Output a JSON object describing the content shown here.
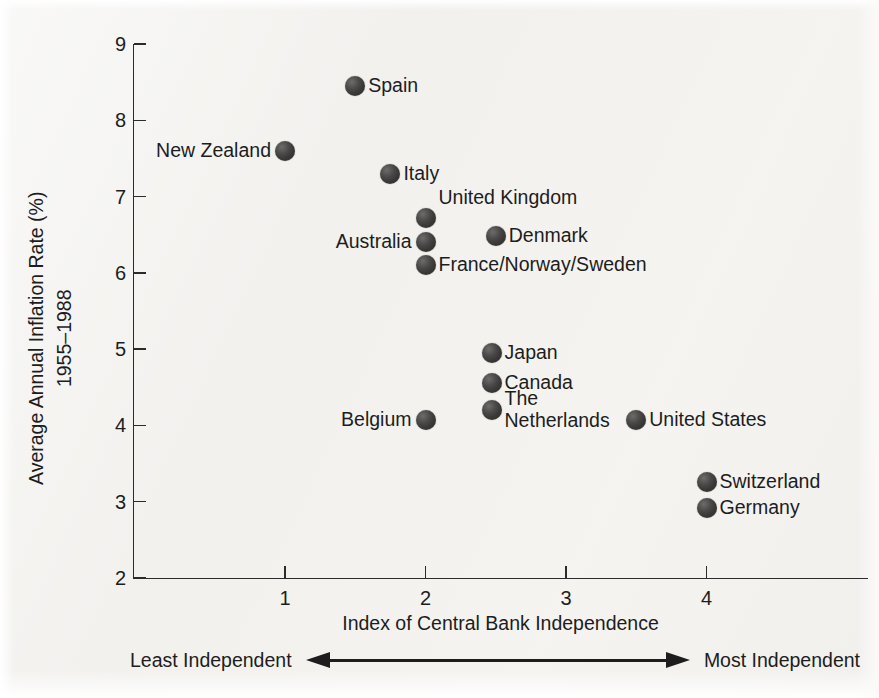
{
  "chart_data": {
    "type": "scatter",
    "title": "",
    "xlabel": "Index of Central Bank Independence",
    "ylabel": "Average Annual Inflation Rate (%)\n1955–1988",
    "ylabel_line1": "Average Annual Inflation Rate (%)",
    "ylabel_line2": "1955–1988",
    "xlim": [
      0,
      5.15
    ],
    "ylim": [
      2,
      9
    ],
    "grid": false,
    "legend": "none",
    "x_ticks": [
      1,
      2,
      3,
      4
    ],
    "x_tick_labels": [
      "1",
      "2",
      "3",
      "4"
    ],
    "y_ticks": [
      2,
      3,
      4,
      5,
      6,
      7,
      8,
      9
    ],
    "y_tick_labels": [
      "2",
      "3",
      "4",
      "5",
      "6",
      "7",
      "8",
      "9"
    ],
    "points": [
      {
        "label": "Spain",
        "x": 1.5,
        "y": 8.45,
        "label_side": "right"
      },
      {
        "label": "New Zealand",
        "x": 1.0,
        "y": 7.6,
        "label_side": "left"
      },
      {
        "label": "Italy",
        "x": 1.75,
        "y": 7.3,
        "label_side": "right"
      },
      {
        "label": "United Kingdom",
        "x": 2.0,
        "y": 6.72,
        "label_side": "right-up"
      },
      {
        "label": "Australia",
        "x": 2.0,
        "y": 6.41,
        "label_side": "left"
      },
      {
        "label": "France/Norway/Sweden",
        "x": 2.0,
        "y": 6.1,
        "label_side": "right"
      },
      {
        "label": "Denmark",
        "x": 2.5,
        "y": 6.48,
        "label_side": "right"
      },
      {
        "label": "Japan",
        "x": 2.47,
        "y": 4.95,
        "label_side": "right"
      },
      {
        "label": "Canada",
        "x": 2.47,
        "y": 4.56,
        "label_side": "right"
      },
      {
        "label": "The\nNetherlands",
        "x": 2.47,
        "y": 4.2,
        "label_side": "right"
      },
      {
        "label": "Belgium",
        "x": 2.0,
        "y": 4.07,
        "label_side": "left"
      },
      {
        "label": "United States",
        "x": 3.5,
        "y": 4.07,
        "label_side": "right"
      },
      {
        "label": "Switzerland",
        "x": 4.0,
        "y": 3.26,
        "label_side": "right"
      },
      {
        "label": "Germany",
        "x": 4.0,
        "y": 2.92,
        "label_side": "right"
      }
    ],
    "annotations": {
      "least_independent": "Least Independent",
      "most_independent": "Most Independent",
      "arrow": "double-headed-horizontal-arrow"
    },
    "colors": {
      "marker": "#3a3837",
      "axis": "#2b2b2b",
      "text": "#1d1d1d",
      "background": "#f2f1ee"
    }
  }
}
